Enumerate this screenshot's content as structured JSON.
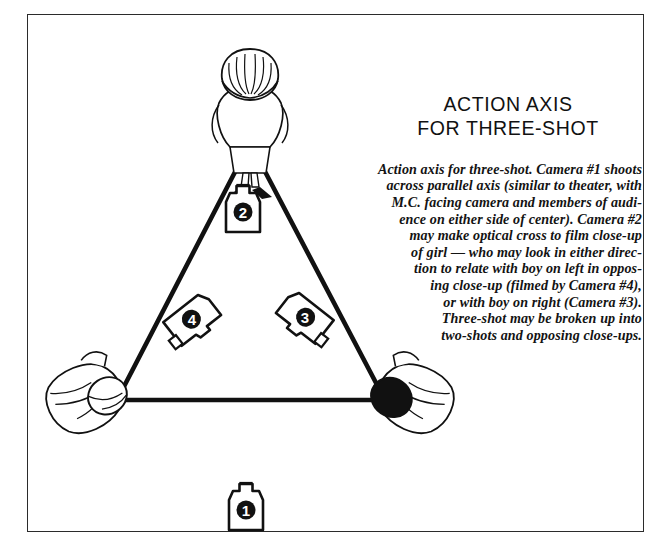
{
  "figure": {
    "kind": "film-production-staging-diagram",
    "frame_color": "#2b2b2b",
    "background_color": "#ffffff",
    "ink_color": "#111111"
  },
  "title": {
    "line1": "ACTION AXIS",
    "line2": "FOR THREE-SHOT"
  },
  "caption": {
    "lines": [
      "Action axis for three-shot. Camera #1 shoots",
      "across parallel axis (similar to theater, with",
      "M.C. facing camera and members of audi-",
      "ence on either side of center). Camera #2",
      "may make optical cross to film close-up",
      "of girl — who may look in either direc-",
      "tion to relate with boy on left in oppos-",
      "ing close-up (filmed by Camera #4),",
      "or with boy on right (Camera #3).",
      "Three-shot may be broken up into",
      "two-shots and opposing close-ups."
    ],
    "full_text": "Action axis for three-shot. Camera #1 shoots across parallel axis (similar to theater, with M.C. facing camera and members of audience on either side of center). Camera #2 may make optical cross to film close-up of girl — who may look in either direction to relate with boy on left in opposing close-up (filmed by Camera #4), or with boy on right (Camera #3). Three-shot may be broken up into two-shots and opposing close-ups."
  },
  "cameras": [
    {
      "id": "camera-1",
      "number": "1",
      "label": "❶",
      "x": 246,
      "y": 508,
      "rotation": 0,
      "note": "below the action axis, outside the triangle"
    },
    {
      "id": "camera-2",
      "number": "2",
      "label": "❷",
      "x": 243,
      "y": 210,
      "rotation": 0,
      "note": "inside triangle, near apex"
    },
    {
      "id": "camera-4",
      "number": "4",
      "label": "❹",
      "x": 192,
      "y": 320,
      "rotation": -38,
      "note": "inside triangle, left, angled toward lower-left"
    },
    {
      "id": "camera-3",
      "number": "3",
      "label": "❸",
      "x": 305,
      "y": 318,
      "rotation": 38,
      "note": "inside triangle, right, angled toward lower-right"
    }
  ],
  "subjects": [
    {
      "id": "subject-girl",
      "role": "girl",
      "x": 250,
      "y": 92,
      "hair": "light",
      "note": "apex of triangle, overhead view"
    },
    {
      "id": "subject-boy-left",
      "role": "boy-left",
      "x": 110,
      "y": 392,
      "hair": "light",
      "note": "left base vertex"
    },
    {
      "id": "subject-boy-right",
      "role": "boy-right",
      "x": 392,
      "y": 392,
      "hair": "dark",
      "note": "right base vertex"
    }
  ],
  "axis_lines": {
    "action_axis_label": "action axis",
    "apex": {
      "x": 250,
      "y": 143
    },
    "left_vertex": {
      "x": 117,
      "y": 400
    },
    "right_vertex": {
      "x": 385,
      "y": 400
    },
    "stroke_color": "#111111",
    "stroke_width": 4.5
  }
}
